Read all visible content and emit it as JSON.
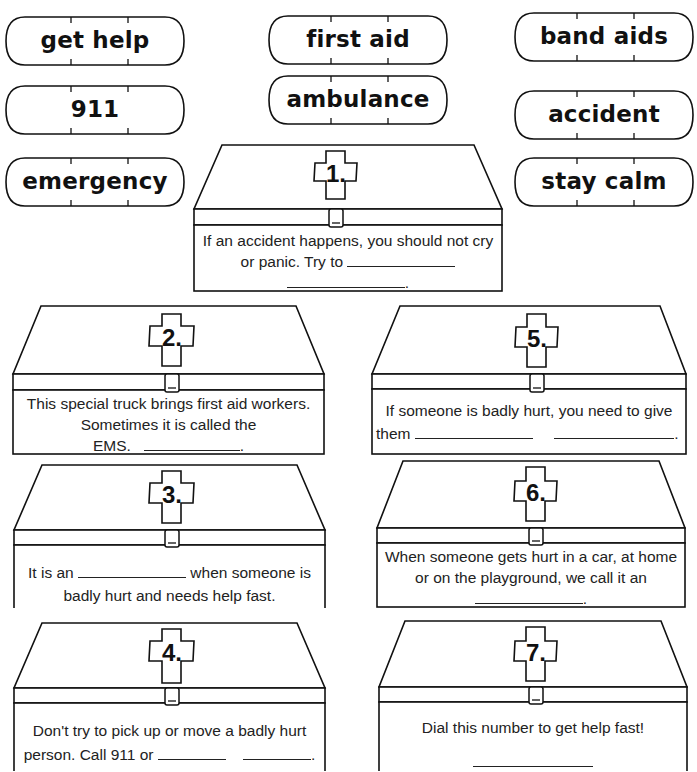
{
  "word_bank": {
    "title": "Word bank",
    "words": [
      {
        "id": "get-help",
        "label": "get help"
      },
      {
        "id": "911",
        "label": "911"
      },
      {
        "id": "emergency",
        "label": "emergency"
      },
      {
        "id": "first-aid",
        "label": "first aid"
      },
      {
        "id": "ambulance",
        "label": "ambulance"
      },
      {
        "id": "band-aids",
        "label": "band aids"
      },
      {
        "id": "accident",
        "label": "accident"
      },
      {
        "id": "stay-calm",
        "label": "stay calm"
      }
    ]
  },
  "questions": [
    {
      "number": "1.",
      "line1": "If an accident happens, you should not cry",
      "line2_prefix": "or panic.  Try to",
      "line3_suffix": "."
    },
    {
      "number": "2.",
      "line1": "This special truck brings first aid workers.",
      "line2": "Sometimes it is called the",
      "line3_prefix": "EMS.",
      "line3_suffix": "."
    },
    {
      "number": "3.",
      "line1_prefix": "It is an",
      "line1_suffix": "when someone is",
      "line2": "badly hurt and needs help fast."
    },
    {
      "number": "4.",
      "line1": "Don't try to pick up or move a badly hurt",
      "line2_prefix": "person.  Call 911 or",
      "line2_suffix": "."
    },
    {
      "number": "5.",
      "line1": "If someone is badly hurt, you need to give",
      "line2_prefix": "them",
      "line2_suffix": "."
    },
    {
      "number": "6.",
      "line1": "When someone gets hurt in a car, at home",
      "line2": "or on the playground, we call it an",
      "line3_suffix": "."
    },
    {
      "number": "7.",
      "line1": "Dial this number to get help fast!"
    }
  ]
}
